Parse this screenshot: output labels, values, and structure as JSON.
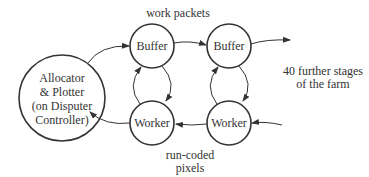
{
  "diagram": {
    "nodes": {
      "allocator": {
        "lines": [
          "Allocator",
          "& Plotter",
          "(on Disputer",
          "Controller)"
        ]
      },
      "buffer1": {
        "label": "Buffer"
      },
      "worker1": {
        "label": "Worker"
      },
      "buffer2": {
        "label": "Buffer"
      },
      "worker2": {
        "label": "Worker"
      }
    },
    "annotations": {
      "top": "work packets",
      "bottom": [
        "run-coded",
        "pixels"
      ],
      "right": [
        "40 further stages",
        "of the farm"
      ]
    },
    "colors": {
      "stroke": "#333333",
      "text": "#333333",
      "background": "#ffffff"
    }
  }
}
